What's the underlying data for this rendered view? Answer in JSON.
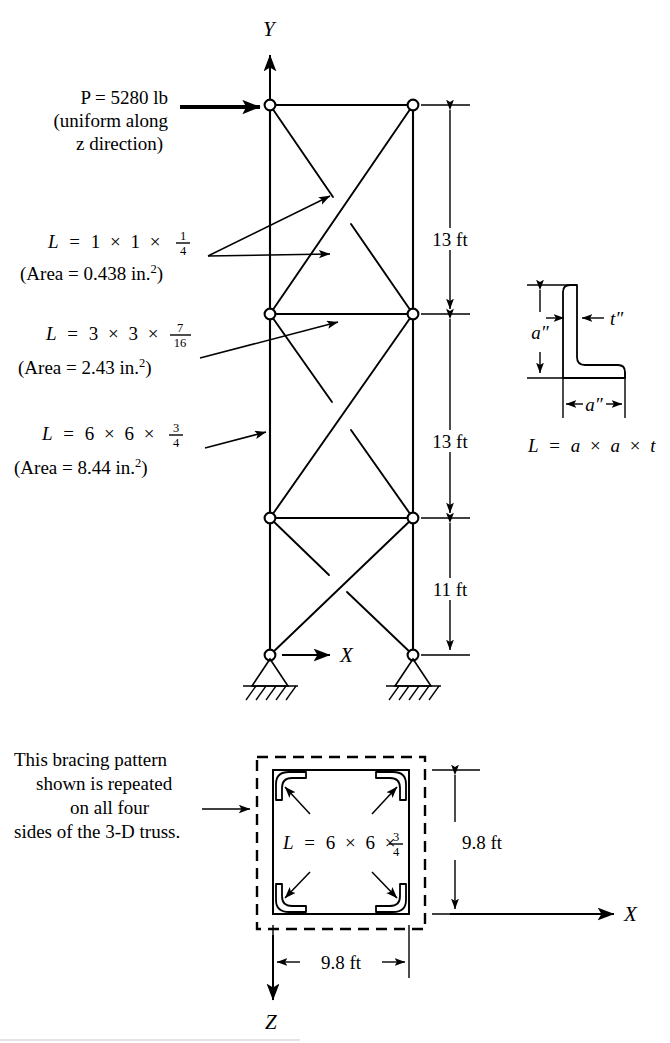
{
  "figure": {
    "type": "engineering-diagram",
    "axes": {
      "y_label": "Y",
      "x_label_elevation": "X",
      "x_label_plan": "X",
      "z_label": "Z"
    },
    "load": {
      "line1": "P = 5280 lb",
      "line2": "(uniform along",
      "line3": "z direction)",
      "magnitude": "5280",
      "units": "lb",
      "direction": "+X (horizontal, applied at top-left joint)"
    },
    "member_callouts": [
      {
        "id": "diagonal-braces",
        "prefix": "L",
        "equals": "=",
        "dim1": "1",
        "times1": "×",
        "dim2": "1",
        "times2": "×",
        "frac_num": "1",
        "frac_den": "4",
        "area_text": "(Area = 0.438 in.",
        "area_sup": "2",
        "area_close": ")",
        "area_value": "0.438",
        "area_units": "in.²"
      },
      {
        "id": "horizontal-struts",
        "prefix": "L",
        "equals": "=",
        "dim1": "3",
        "times1": "×",
        "dim2": "3",
        "times2": "×",
        "frac_num": "7",
        "frac_den": "16",
        "area_text": "(Area = 2.43 in.",
        "area_sup": "2",
        "area_close": ")",
        "area_value": "2.43",
        "area_units": "in.²"
      },
      {
        "id": "main-legs",
        "prefix": "L",
        "equals": "=",
        "dim1": "6",
        "times1": "×",
        "dim2": "6",
        "times2": "×",
        "frac_num": "3",
        "frac_den": "4",
        "area_text": "(Area = 8.44 in.",
        "area_sup": "2",
        "area_close": ")",
        "area_value": "8.44",
        "area_units": "in.²"
      }
    ],
    "vertical_dimensions": [
      {
        "label": "13 ft",
        "value": 13,
        "units": "ft",
        "panel": "top"
      },
      {
        "label": "13 ft",
        "value": 13,
        "units": "ft",
        "panel": "middle"
      },
      {
        "label": "11 ft",
        "value": 11,
        "units": "ft",
        "panel": "bottom"
      }
    ],
    "angle_section": {
      "leg_vertical_label": "a″",
      "leg_horizontal_label": "a″",
      "thickness_label": "t″",
      "formula_prefix": "L",
      "formula_equals": "=",
      "formula_a1": "a",
      "formula_times1": "×",
      "formula_a2": "a",
      "formula_times2": "×",
      "formula_t": "t"
    },
    "plan_view": {
      "note_line1": "This bracing pattern",
      "note_line2": "shown is repeated",
      "note_line3": "on all four",
      "note_line4": "sides of the 3-D truss.",
      "member_prefix": "L",
      "member_equals": "=",
      "member_dim1": "6",
      "member_times1": "×",
      "member_dim2": "6",
      "member_times2": "×",
      "member_frac_num": "3",
      "member_frac_den": "4",
      "width_label": "9.8 ft",
      "depth_label": "9.8 ft",
      "width_value": 9.8,
      "depth_value": 9.8,
      "units": "ft",
      "corner_count": 4
    },
    "colors": {
      "ink": "#000000",
      "paper": "#ffffff"
    }
  }
}
